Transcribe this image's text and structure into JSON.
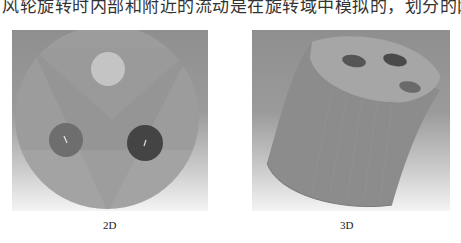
{
  "document": {
    "body_text_partial": "风轮旋转时内部和附近的流动是在旋转域中模拟的，划分的网格如图 11-15 所示"
  },
  "figures": [
    {
      "caption": "2D",
      "description": "Circular domain mesh cross-section with three holes (one light, two dark) and triangular mesh zone",
      "colors": {
        "background": "#939393",
        "disk": "#9c9c9c",
        "light_hole": "#c4c4c4",
        "left_hole": "#6e6e6e",
        "right_hole": "#444444"
      }
    },
    {
      "caption": "3D",
      "description": "Cylindrical rotating domain mesh in 3D view with three holes on top face",
      "colors": {
        "body": "#8c8c8c",
        "top_face": "#a6a6a6",
        "holes": "#555555"
      }
    }
  ]
}
